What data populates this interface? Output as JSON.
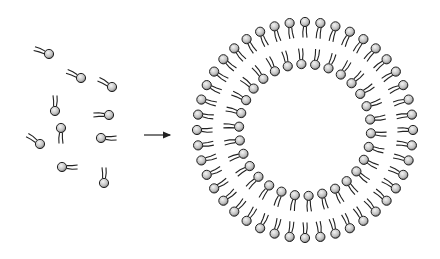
{
  "diagram": {
    "title": "",
    "colors": {
      "background": "#ffffff",
      "head_fill_light": "#e6e6e6",
      "head_fill_dark": "#8c8c8c",
      "outline": "#222222",
      "tail": "#222222"
    },
    "free_lipids": [
      {
        "x": 49,
        "y": 54,
        "angle": 200
      },
      {
        "x": 81,
        "y": 78,
        "angle": 205
      },
      {
        "x": 112,
        "y": 87,
        "angle": 210
      },
      {
        "x": 55,
        "y": 111,
        "angle": 270
      },
      {
        "x": 109,
        "y": 115,
        "angle": 180
      },
      {
        "x": 61,
        "y": 128,
        "angle": 90
      },
      {
        "x": 40,
        "y": 144,
        "angle": 215
      },
      {
        "x": 101,
        "y": 138,
        "angle": 0
      },
      {
        "x": 62,
        "y": 167,
        "angle": 0
      },
      {
        "x": 104,
        "y": 183,
        "angle": 270
      }
    ],
    "arrow": {
      "x1": 144,
      "y1": 135,
      "x2": 170,
      "y2": 135
    },
    "vesicle": {
      "cx": 305,
      "cy": 130,
      "outer_radius": 108,
      "inner_radius": 66,
      "outer_count": 44,
      "inner_count": 30,
      "label_outer": "outer leaflet",
      "label_inner": "inner leaflet"
    }
  }
}
